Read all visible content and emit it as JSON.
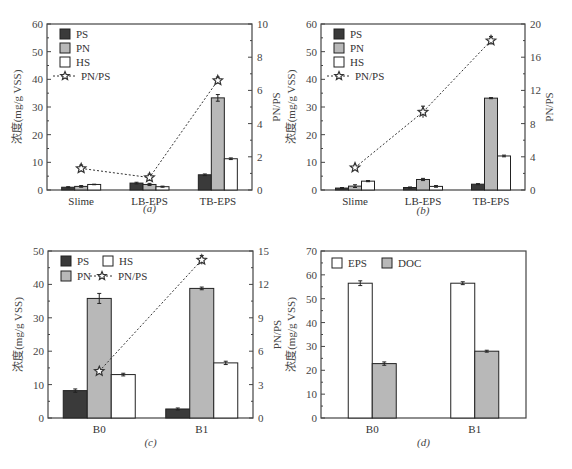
{
  "chart_data": [
    {
      "panel": "a",
      "caption": "(a)",
      "type": "bar",
      "categories": [
        "Slime",
        "LB-EPS",
        "TB-EPS"
      ],
      "ylabel": "浓度(mg/g VSS)",
      "ylim": [
        0,
        60
      ],
      "yticks": [
        0,
        10,
        20,
        30,
        40,
        50,
        60
      ],
      "y2label": "PN/PS",
      "y2lim": [
        0,
        10
      ],
      "y2ticks": [
        0,
        2,
        4,
        6,
        8,
        10
      ],
      "series": [
        {
          "name": "PS",
          "values": [
            1.0,
            2.5,
            5.5
          ],
          "errors": [
            0.2,
            0.3,
            0.3
          ]
        },
        {
          "name": "PN",
          "values": [
            1.3,
            2.0,
            33.3
          ],
          "errors": [
            0.3,
            0.4,
            1.2
          ]
        },
        {
          "name": "HS",
          "values": [
            2.0,
            1.2,
            11.3
          ],
          "errors": [
            0.1,
            0.2,
            0.3
          ]
        }
      ],
      "line": {
        "name": "PN/PS",
        "axis": "right",
        "values": [
          1.3,
          0.75,
          6.6
        ],
        "errors": [
          0.2,
          0.2,
          0.2
        ]
      },
      "legend": {
        "layout": "column",
        "position": "upper-left",
        "labels": [
          "PS",
          "PN",
          "HS",
          "PN/PS"
        ]
      }
    },
    {
      "panel": "b",
      "caption": "(b)",
      "type": "bar",
      "categories": [
        "Slime",
        "LB-EPS",
        "TB-EPS"
      ],
      "ylabel": "浓度(mg/g VSS)",
      "ylim": [
        0,
        60
      ],
      "yticks": [
        0,
        10,
        20,
        30,
        40,
        50,
        60
      ],
      "y2label": "PN/PS",
      "y2lim": [
        0,
        20
      ],
      "y2ticks": [
        0,
        4,
        8,
        12,
        16,
        20
      ],
      "series": [
        {
          "name": "PS",
          "values": [
            0.7,
            0.9,
            2.1
          ],
          "errors": [
            0.2,
            0.2,
            0.2
          ]
        },
        {
          "name": "PN",
          "values": [
            1.4,
            3.8,
            33.2
          ],
          "errors": [
            0.5,
            0.4,
            0.2
          ]
        },
        {
          "name": "HS",
          "values": [
            3.2,
            1.3,
            12.3
          ],
          "errors": [
            0.2,
            0.3,
            0.3
          ]
        }
      ],
      "line": {
        "name": "PN/PS",
        "axis": "right",
        "values": [
          2.7,
          9.4,
          18.0
        ],
        "errors": [
          0.2,
          0.7,
          0.5
        ]
      },
      "legend": {
        "layout": "column",
        "position": "upper-left",
        "labels": [
          "PS",
          "PN",
          "HS",
          "PN/PS"
        ]
      }
    },
    {
      "panel": "c",
      "caption": "(c)",
      "type": "bar",
      "categories": [
        "B0",
        "B1"
      ],
      "ylabel": "浓度(mg/g VSS)",
      "ylim": [
        0,
        50
      ],
      "yticks": [
        0,
        10,
        20,
        30,
        40,
        50
      ],
      "y2label": "PN/PS",
      "y2lim": [
        0,
        15
      ],
      "y2ticks": [
        0,
        3,
        6,
        9,
        12,
        15
      ],
      "series": [
        {
          "name": "PS",
          "values": [
            8.2,
            2.7
          ],
          "errors": [
            0.5,
            0.3
          ]
        },
        {
          "name": "PN",
          "values": [
            35.8,
            38.8
          ],
          "errors": [
            1.5,
            0.4
          ]
        },
        {
          "name": "HS",
          "values": [
            13.0,
            16.5
          ],
          "errors": [
            0.4,
            0.5
          ]
        }
      ],
      "line": {
        "name": "PN/PS",
        "axis": "right",
        "values": [
          4.2,
          14.2
        ],
        "errors": [
          0.1,
          0.4
        ]
      },
      "legend": {
        "layout": "grid",
        "position": "upper-left",
        "labels": [
          "PS",
          "HS",
          "PN",
          "PN/PS"
        ]
      }
    },
    {
      "panel": "d",
      "caption": "(d)",
      "type": "bar",
      "categories": [
        "B0",
        "B1"
      ],
      "ylabel": "浓度(mg/g VSS)",
      "ylim": [
        0,
        70
      ],
      "yticks": [
        0,
        10,
        20,
        30,
        40,
        50,
        60,
        70
      ],
      "series": [
        {
          "name": "EPS",
          "values": [
            56.5,
            56.5
          ],
          "errors": [
            1.0,
            0.6
          ]
        },
        {
          "name": "DOC",
          "values": [
            22.8,
            28.0
          ],
          "errors": [
            0.7,
            0.4
          ]
        }
      ],
      "legend": {
        "layout": "row",
        "position": "upper-left",
        "labels": [
          "EPS",
          "DOC"
        ]
      }
    }
  ],
  "style": {
    "colors": {
      "PS": "#3a3a3a",
      "PN": "#b8b8b8",
      "HS": "#ffffff",
      "EPS": "#ffffff",
      "DOC": "#b8b8b8",
      "axis": "#444444",
      "line": "#333333"
    }
  }
}
